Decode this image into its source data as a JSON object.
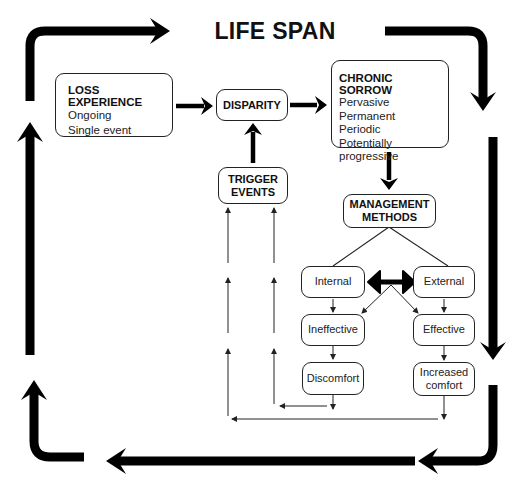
{
  "title": "LIFE SPAN",
  "nodes": {
    "loss_experience": {
      "heading": "LOSS EXPERIENCE",
      "items": [
        "Ongoing",
        "Single event"
      ]
    },
    "disparity": {
      "label": "DISPARITY"
    },
    "chronic_sorrow": {
      "heading": "CHRONIC SORROW",
      "items": [
        "Pervasive",
        "Permanent",
        "Periodic",
        "Potentially progressive"
      ]
    },
    "trigger_events": {
      "line1": "TRIGGER",
      "line2": "EVENTS"
    },
    "management_methods": {
      "line1": "MANAGEMENT",
      "line2": "METHODS"
    },
    "internal": {
      "label": "Internal"
    },
    "external": {
      "label": "External"
    },
    "ineffective": {
      "label": "Ineffective"
    },
    "effective": {
      "label": "Effective"
    },
    "discomfort": {
      "label": "Discomfort"
    },
    "increased_comfort": {
      "line1": "Increased",
      "line2": "comfort"
    }
  },
  "edges": [
    {
      "from": "loss_experience",
      "to": "disparity",
      "style": "thick"
    },
    {
      "from": "disparity",
      "to": "chronic_sorrow",
      "style": "thick"
    },
    {
      "from": "chronic_sorrow",
      "to": "management_methods",
      "style": "thick"
    },
    {
      "from": "trigger_events",
      "to": "disparity",
      "style": "thick"
    },
    {
      "from": "management_methods",
      "to": "internal",
      "style": "line"
    },
    {
      "from": "management_methods",
      "to": "external",
      "style": "line"
    },
    {
      "from": "internal",
      "to": "external",
      "style": "thick-bidirectional"
    },
    {
      "from": "internal",
      "to": "effective",
      "style": "thin"
    },
    {
      "from": "external",
      "to": "ineffective",
      "style": "thin"
    },
    {
      "from": "internal",
      "to": "ineffective",
      "style": "thin"
    },
    {
      "from": "external",
      "to": "effective",
      "style": "thin"
    },
    {
      "from": "ineffective",
      "to": "discomfort",
      "style": "thin"
    },
    {
      "from": "effective",
      "to": "increased_comfort",
      "style": "thin"
    },
    {
      "from": "discomfort",
      "to": "trigger_events",
      "style": "thin"
    },
    {
      "from": "increased_comfort",
      "to": "trigger_events",
      "style": "thin"
    }
  ],
  "frame": {
    "label": "life-span cycle (clockwise)",
    "color": "#000000"
  }
}
